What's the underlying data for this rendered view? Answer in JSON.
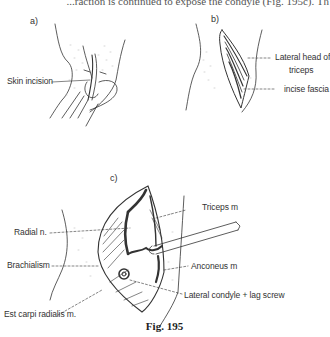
{
  "page": {
    "top_text_fragment": "...raction is continued to expose the condyle (Fig. 195c). Th"
  },
  "figure": {
    "caption": "Fig. 195",
    "panels": [
      {
        "id": "a",
        "label": "a)",
        "callouts": [
          {
            "text": "Skin incision"
          }
        ]
      },
      {
        "id": "b",
        "label": "b)",
        "callouts": [
          {
            "text": "Lateral head of"
          },
          {
            "text": "triceps"
          },
          {
            "text": "incise fascia"
          }
        ]
      },
      {
        "id": "c",
        "label": "c)",
        "callouts": [
          {
            "text": "Radial n."
          },
          {
            "text": "Brachialism"
          },
          {
            "text": "Est carpi radialis m."
          },
          {
            "text": "Triceps m"
          },
          {
            "text": "Anconeus m"
          },
          {
            "text": "Lateral condyle + lag screw"
          }
        ]
      }
    ]
  },
  "colors": {
    "ink": "#2a2a2a",
    "stipple": "#b8b8b8",
    "paper": "#ffffff"
  }
}
